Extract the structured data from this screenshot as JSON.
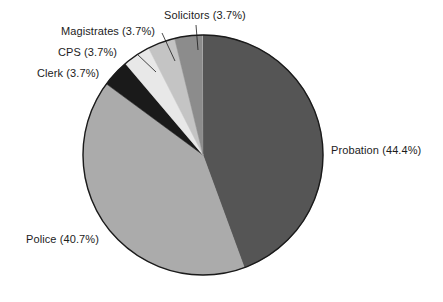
{
  "chart_data": {
    "type": "pie",
    "title": "",
    "subtitle": "",
    "xlabel": "",
    "ylabel": "",
    "legend_position": "none",
    "grid": false,
    "units": "percent",
    "start_angle_deg": -90,
    "direction": "clockwise",
    "categories": [
      "Probation",
      "Police",
      "Clerk",
      "CPS",
      "Magistrates",
      "Solicitors"
    ],
    "values": [
      44.4,
      40.7,
      3.7,
      3.7,
      3.7,
      3.7
    ],
    "total": 99.9,
    "slices": [
      {
        "name": "Probation",
        "value": 44.4,
        "label": "Probation (44.4%)",
        "color": "#555555",
        "start_deg": -90,
        "sweep_deg": 159.84,
        "label_side": "right"
      },
      {
        "name": "Police",
        "value": 40.7,
        "label": "Police (40.7%)",
        "color": "#ababab",
        "start_deg": 69.84,
        "sweep_deg": 146.52,
        "label_side": "left"
      },
      {
        "name": "Clerk",
        "value": 3.7,
        "label": "Clerk (3.7%)",
        "color": "#1a1a1a",
        "start_deg": 216.36,
        "sweep_deg": 13.32,
        "label_side": "left"
      },
      {
        "name": "CPS",
        "value": 3.7,
        "label": "CPS (3.7%)",
        "color": "#e8e8e8",
        "start_deg": 229.68,
        "sweep_deg": 13.32,
        "label_side": "left"
      },
      {
        "name": "Magistrates",
        "value": 3.7,
        "label": "Magistrates (3.7%)",
        "color": "#c4c4c4",
        "start_deg": 243.0,
        "sweep_deg": 13.32,
        "label_side": "left"
      },
      {
        "name": "Solicitors",
        "value": 3.7,
        "label": "Solicitors (3.7%)",
        "color": "#8c8c8c",
        "start_deg": 256.32,
        "sweep_deg": 13.32,
        "label_side": "top"
      }
    ],
    "geometry": {
      "center_x": 203,
      "center_y": 155,
      "radius": 120,
      "outline_color": "#1a1a1a",
      "outline_width": 1.4,
      "background": "#ffffff"
    },
    "leader_lines": [
      {
        "name": "clerk",
        "x1": 122,
        "y1": 75,
        "x2": 141,
        "y2": 88
      },
      {
        "name": "cps",
        "x1": 137,
        "y1": 54,
        "x2": 156,
        "y2": 72
      },
      {
        "name": "magistrates",
        "x1": 162,
        "y1": 33,
        "x2": 175,
        "y2": 61
      },
      {
        "name": "solicitors",
        "x1": 196,
        "y1": 25,
        "x2": 198,
        "y2": 50
      }
    ]
  }
}
